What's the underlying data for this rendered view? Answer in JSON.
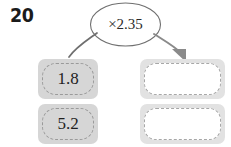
{
  "worksheet": {
    "question_number": "20",
    "operation": "×2.35",
    "operation_icon": "multiply-oval",
    "arrow_left_icon": "curved-line",
    "arrow_right_icon": "curved-arrow-down",
    "colors": {
      "panel_gray": "#d6d6d6",
      "answer_panel_gray": "#e2e2e2",
      "dash_border": "#9a9a9a",
      "outline": "#6f6f6f",
      "text": "#1f1f1f",
      "background": "#ffffff"
    }
  },
  "rows": [
    {
      "input_value": "1.8",
      "output_value": "",
      "output_placeholder": ""
    },
    {
      "input_value": "5.2",
      "output_value": "",
      "output_placeholder": ""
    }
  ]
}
